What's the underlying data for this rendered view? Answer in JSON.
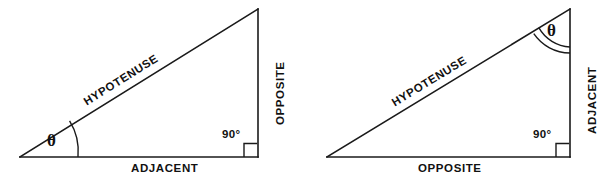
{
  "figure": {
    "stroke_color": "#1a1a1a",
    "background_color": "#ffffff",
    "width": 608,
    "height": 186
  },
  "diagrams": [
    {
      "id": "left-triangle",
      "name": "theta-at-bottom-left-vertex",
      "labels": {
        "hypotenuse": "HYPOTENUSE",
        "opposite": "OPPOSITE",
        "adjacent": "ADJACENT",
        "theta": "θ",
        "right_angle": "90°"
      },
      "vertices": {
        "bottom_left": [
          20,
          157
        ],
        "bottom_right": [
          258,
          157
        ],
        "apex": [
          258,
          9
        ]
      },
      "angle_marks": {
        "theta_arcs": 1,
        "right_angle_square": true
      },
      "side_roles": {
        "bottom": "ADJACENT",
        "vertical": "OPPOSITE",
        "slanted": "HYPOTENUSE"
      }
    },
    {
      "id": "right-triangle",
      "name": "theta-at-top-vertex",
      "labels": {
        "hypotenuse": "HYPOTENUSE",
        "opposite": "OPPOSITE",
        "adjacent": "ADJACENT",
        "theta": "θ",
        "right_angle": "90°"
      },
      "vertices": {
        "bottom_left": [
          327,
          157
        ],
        "bottom_right": [
          570,
          157
        ],
        "apex": [
          570,
          9
        ]
      },
      "angle_marks": {
        "theta_arcs": 2,
        "right_angle_square": true
      },
      "side_roles": {
        "bottom": "OPPOSITE",
        "vertical": "ADJACENT",
        "slanted": "HYPOTENUSE"
      }
    }
  ]
}
